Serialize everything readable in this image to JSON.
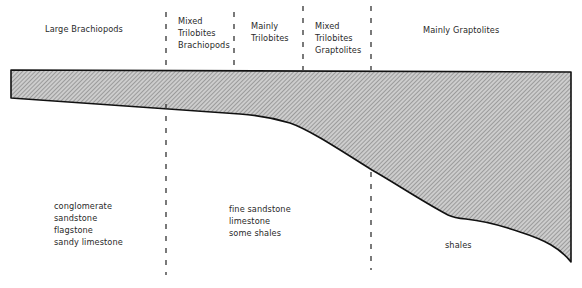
{
  "diagram": {
    "type": "facies-cross-section",
    "fauna_zones": [
      {
        "id": "large-brachiopods",
        "lines": [
          "Large Brachiopods"
        ]
      },
      {
        "id": "mixed-trilobites-brachiopods",
        "lines": [
          "Mixed",
          "Trilobites",
          "Brachiopods"
        ]
      },
      {
        "id": "mainly-trilobites",
        "lines": [
          "Mainly",
          "Trilobites"
        ]
      },
      {
        "id": "mixed-trilobites-graptolites",
        "lines": [
          "Mixed",
          "Trilobites",
          "Graptolites"
        ]
      },
      {
        "id": "mainly-graptolites",
        "lines": [
          "Mainly Graptolites"
        ]
      }
    ],
    "lithologies": [
      {
        "id": "nearshore",
        "lines": [
          "conglomerate",
          "sandstone",
          "flagstone",
          "sandy limestone"
        ]
      },
      {
        "id": "shelf",
        "lines": [
          "fine sandstone",
          "limestone",
          "some shales"
        ]
      },
      {
        "id": "basin",
        "lines": [
          "shales"
        ]
      }
    ],
    "colors": {
      "outline": "#111111",
      "fill_base": "#c8c8c8",
      "hatch": "#6e6e6e",
      "divider": "#333333",
      "text": "#2a2a2a"
    }
  }
}
